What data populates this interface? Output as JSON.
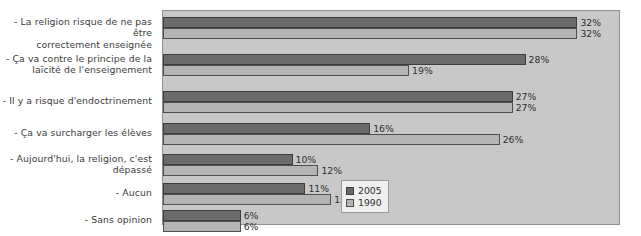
{
  "chart_data": {
    "type": "bar",
    "orientation": "horizontal",
    "title": "",
    "subtitle": "",
    "xlabel": "",
    "ylabel": "",
    "xlim": [
      0,
      35
    ],
    "grid": false,
    "legend_position": "bottom-right",
    "value_suffix": "%",
    "categories": [
      "- La religion risque de ne pas être correctement enseignée",
      "- Ça va contre le principe de la laïcité de l'enseignement",
      "- Il y a risque d'endoctrinement",
      "- Ça va surcharger les élèves",
      "- Aujourd'hui, la religion, c'est dépassé",
      "- Aucun",
      "- Sans opinion"
    ],
    "category_lines": [
      [
        "- La religion risque de ne pas être",
        "correctement enseignée"
      ],
      [
        "- Ça va contre le principe de la",
        "laïcité de l'enseignement"
      ],
      [
        "- Il y a risque d'endoctrinement"
      ],
      [
        "- Ça va surcharger les élèves"
      ],
      [
        "- Aujourd'hui, la religion, c'est",
        "dépassé"
      ],
      [
        "- Aucun"
      ],
      [
        "- Sans opinion"
      ]
    ],
    "series": [
      {
        "name": "2005",
        "color": "#6b6b6b",
        "values": [
          32,
          28,
          27,
          16,
          10,
          11,
          6
        ],
        "labels": [
          "32%",
          "28%",
          "27%",
          "16%",
          "10%",
          "11%",
          "6%"
        ]
      },
      {
        "name": "1990",
        "color": "#b4b4b4",
        "values": [
          32,
          19,
          27,
          26,
          12,
          13,
          6
        ],
        "labels": [
          "32%",
          "19%",
          "27%",
          "26%",
          "12%",
          "13%",
          "6%"
        ]
      }
    ]
  },
  "legend": {
    "entries": [
      {
        "label": "2005",
        "swatch": "dark-gray-swatch"
      },
      {
        "label": "1990",
        "swatch": "light-gray-swatch"
      }
    ]
  }
}
